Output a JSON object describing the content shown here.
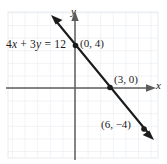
{
  "figure": {
    "kind": "coordinate-graph",
    "background": "#ffffff",
    "width": 167,
    "height": 164
  },
  "chart_data": {
    "type": "line",
    "title": "",
    "xlabel": "x",
    "ylabel": "y",
    "equation": "4x + 3y = 12",
    "equation_parts": {
      "coefficient_x": "4",
      "var_x": "x",
      "plus": " + ",
      "coefficient_y": "3",
      "var_y": "y",
      "equals": " = ",
      "constant": "12"
    },
    "series": [
      {
        "name": "4x + 3y = 12",
        "x": [
          -2,
          0,
          3,
          6,
          8
        ],
        "y": [
          6.667,
          4,
          0,
          -4,
          -6.667
        ],
        "slope": -1.3333,
        "intercept": 4,
        "color": "#1b1b1b",
        "arrows": "both"
      }
    ],
    "points": [
      {
        "label": "(0, 4)",
        "x": 0,
        "y": 4,
        "marker": "dot"
      },
      {
        "label": "(3, 0)",
        "x": 3,
        "y": 0,
        "marker": "dot"
      },
      {
        "label": "(6, −4)",
        "x": 6,
        "y": -4,
        "marker": "dot"
      }
    ],
    "xlim": [
      -5.5,
      6.8
    ],
    "ylim": [
      -5.8,
      6.2
    ],
    "grid": true,
    "grid_spacing": 1,
    "grid_color": "#d8dce3",
    "axis_color": "#555555",
    "legend": "none"
  },
  "labels": {
    "equation": "4x + 3y = 12",
    "point_a": "(0, 4)",
    "point_b": "(3, 0)",
    "point_c": "(6, −4)",
    "axis_x": "x",
    "axis_y": "y"
  }
}
